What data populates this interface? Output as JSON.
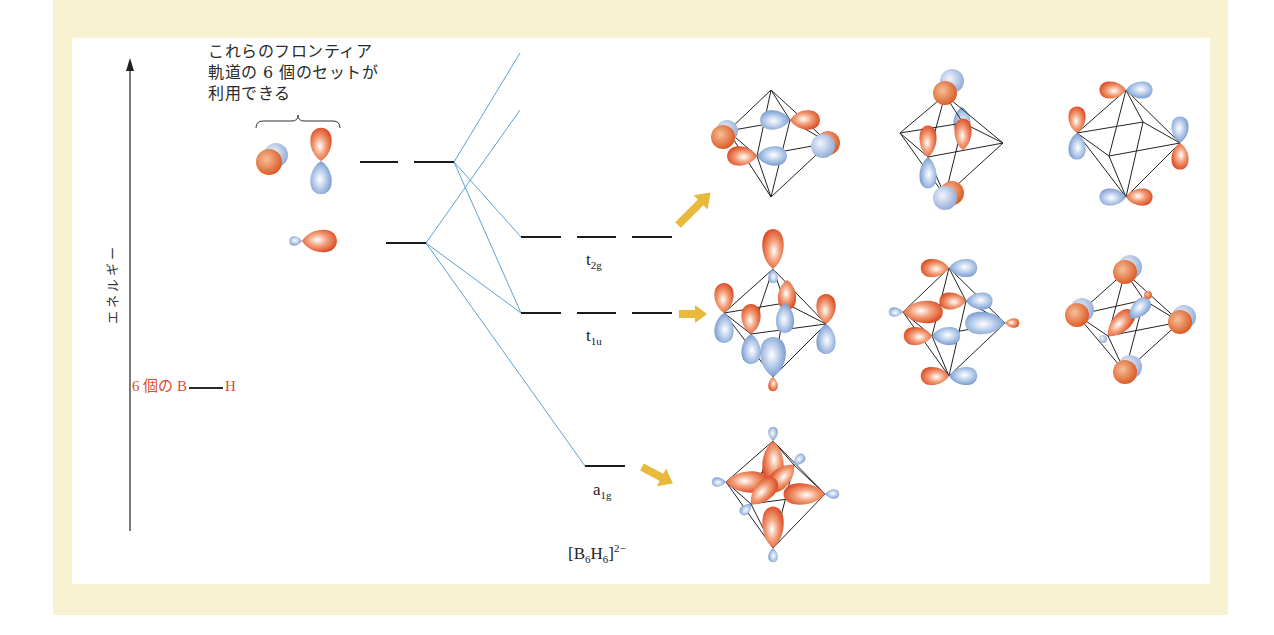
{
  "figure": {
    "title_note": {
      "lines": [
        "これらのフロンティア",
        "軌道の 6 個のセットが",
        "利用できる"
      ]
    },
    "y_axis": {
      "label": "エネルギー",
      "direction": "up"
    },
    "fragment_label": {
      "prefix": "6 個の",
      "atom1": "B",
      "atom2": "H"
    },
    "molecule_label": {
      "base": "[B",
      "sub1": "6",
      "mid": "H",
      "sub2": "6",
      "close": "]",
      "charge": "2−"
    },
    "levels": [
      {
        "name": "t2g",
        "main": "t",
        "sub": "2g",
        "degeneracy": 3
      },
      {
        "name": "t1u",
        "main": "t",
        "sub": "1u",
        "degeneracy": 3
      },
      {
        "name": "a1g",
        "main": "a",
        "sub": "1g",
        "degeneracy": 1
      }
    ],
    "fragment_levels": [
      {
        "name": "frontier-p",
        "degeneracy": 2
      },
      {
        "name": "sp-hybrid",
        "degeneracy": 1
      }
    ],
    "colors": {
      "phase_positive": "#e0562b",
      "phase_negative": "#8fb0dc",
      "correlation_line": "#5aa3d6",
      "arrow": "#e8b93a",
      "label_red": "#d8502a",
      "frame_bg": "#f8f1d2"
    }
  }
}
